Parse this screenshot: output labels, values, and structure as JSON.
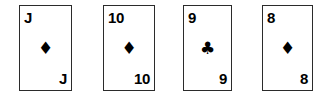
{
  "scene": {
    "title": "Playing card hand",
    "background_color": "#ffffff",
    "card_face_color": "#ffffff",
    "card_border_color": "#2b2b2b",
    "pip_color": "#000000"
  },
  "cards": [
    {
      "name": "card-jack-of-diamonds",
      "rank": "J",
      "suit_name": "diamond",
      "suit_symbol": "♦",
      "color": "#000000"
    },
    {
      "name": "card-ten-of-diamonds",
      "rank": "10",
      "suit_name": "diamond",
      "suit_symbol": "♦",
      "color": "#000000"
    },
    {
      "name": "card-nine-of-clubs",
      "rank": "9",
      "suit_name": "club",
      "suit_symbol": "♣",
      "color": "#000000"
    },
    {
      "name": "card-eight-of-diamonds",
      "rank": "8",
      "suit_name": "diamond",
      "suit_symbol": "♦",
      "color": "#000000"
    }
  ]
}
